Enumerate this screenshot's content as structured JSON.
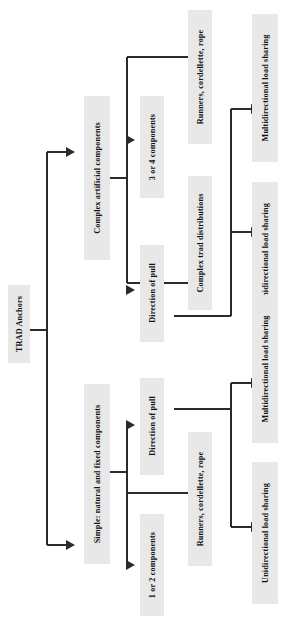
{
  "diagram": {
    "orientation": "rotated-90-counterclockwise",
    "colors": {
      "node_fill": "#e8e8e8",
      "node_text": "#111111",
      "connector": "#2b2b2b",
      "background": "#ffffff"
    },
    "nodes": {
      "root": "TRAD Anchors",
      "branch_complex": "Complex artificial components",
      "branch_simple": "Simple: natural and fixed components",
      "complex_3or4": "3 or 4 components",
      "complex_direction_of_pull": "Direction of pull",
      "complex_runners": "Runners, cordellette, rope",
      "complex_trad_distributions": "Complex trad distributions",
      "complex_multidirectional": "Multidirectional load sharing",
      "complex_unidirectional": "Unidirectional load sharing",
      "simple_direction_of_pull": "Direction of pull",
      "simple_1or2": "1 or 2 components",
      "simple_runners": "Runners, cordellette, rope",
      "simple_multidirectional": "Multidirectional load sharing",
      "simple_unidirectional": "Unidirectional load sharing"
    },
    "edges": [
      {
        "from": "root",
        "to": "branch_complex"
      },
      {
        "from": "root",
        "to": "branch_simple"
      },
      {
        "from": "branch_complex",
        "to": "complex_3or4"
      },
      {
        "from": "branch_complex",
        "to": "complex_direction_of_pull"
      },
      {
        "from": "branch_complex",
        "to": "complex_trad_distributions"
      },
      {
        "from": "complex_3or4",
        "to": "complex_runners"
      },
      {
        "from": "complex_trad_distributions",
        "to": "complex_unidirectional"
      },
      {
        "from": "complex_direction_of_pull",
        "to": "complex_multidirectional"
      },
      {
        "from": "branch_simple",
        "to": "simple_direction_of_pull"
      },
      {
        "from": "branch_simple",
        "to": "simple_1or2"
      },
      {
        "from": "branch_simple",
        "to": "simple_runners"
      },
      {
        "from": "simple_direction_of_pull",
        "to": "simple_multidirectional"
      },
      {
        "from": "simple_direction_of_pull",
        "to": "simple_unidirectional"
      }
    ]
  }
}
